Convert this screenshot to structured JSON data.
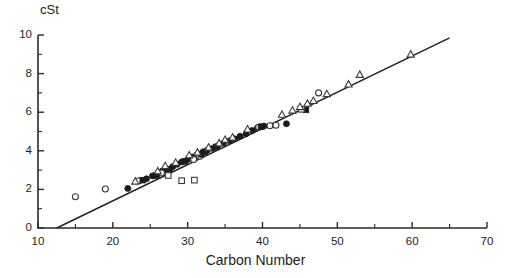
{
  "chart_data": {
    "type": "scatter",
    "title": "",
    "xlabel": "Carbon Number",
    "ylabel": "cSt",
    "ylabel_position": "top-left",
    "xlim": [
      10,
      70
    ],
    "ylim": [
      0,
      10
    ],
    "xticks": [
      10,
      20,
      30,
      40,
      50,
      60,
      70
    ],
    "yticks": [
      0,
      2,
      4,
      6,
      8,
      10
    ],
    "xtick_labels": [
      "10",
      "20",
      "30",
      "40",
      "50",
      "60",
      "70"
    ],
    "ytick_labels": [
      "0",
      "2",
      "4",
      "6",
      "8",
      "10"
    ],
    "x_minor_interval": 5,
    "y_minor_interval": 1,
    "grid": false,
    "legend": "none",
    "frame": "left-and-bottom-spines",
    "fit_line": {
      "name": "regression line",
      "x_start": 12.5,
      "y_start": 0.0,
      "x_end": 65.0,
      "y_end": 9.85,
      "slope": 0.1876,
      "intercept": -2.345
    },
    "series": [
      {
        "name": "filled-circle",
        "marker": "filled circle",
        "points": [
          [
            22.0,
            2.05
          ],
          [
            24.5,
            2.55
          ],
          [
            25.3,
            2.7
          ],
          [
            26.0,
            2.8
          ],
          [
            26.6,
            2.95
          ],
          [
            27.2,
            3.02
          ],
          [
            28.0,
            3.18
          ],
          [
            28.6,
            3.3
          ],
          [
            29.2,
            3.42
          ],
          [
            30.0,
            3.55
          ],
          [
            30.6,
            3.68
          ],
          [
            31.2,
            3.78
          ],
          [
            32.0,
            3.92
          ],
          [
            32.6,
            4.02
          ],
          [
            33.3,
            4.12
          ],
          [
            34.0,
            4.25
          ],
          [
            34.8,
            4.4
          ],
          [
            35.6,
            4.52
          ],
          [
            36.3,
            4.62
          ],
          [
            37.0,
            4.75
          ],
          [
            37.8,
            4.88
          ],
          [
            38.6,
            5.05
          ],
          [
            39.3,
            5.18
          ],
          [
            40.2,
            5.28
          ],
          [
            43.2,
            5.4
          ]
        ]
      },
      {
        "name": "open-circle",
        "marker": "open circle",
        "points": [
          [
            15.0,
            1.62
          ],
          [
            19.0,
            2.02
          ],
          [
            23.5,
            2.45
          ],
          [
            26.5,
            2.85
          ],
          [
            30.8,
            3.55
          ],
          [
            31.6,
            3.72
          ],
          [
            39.5,
            5.22
          ],
          [
            41.0,
            5.3
          ],
          [
            41.8,
            5.32
          ],
          [
            47.5,
            7.0
          ]
        ]
      },
      {
        "name": "filled-square",
        "marker": "filled square",
        "points": [
          [
            24.0,
            2.48
          ],
          [
            25.8,
            2.72
          ],
          [
            27.6,
            3.05
          ],
          [
            29.6,
            3.45
          ],
          [
            31.8,
            3.82
          ],
          [
            32.3,
            3.95
          ],
          [
            33.8,
            4.2
          ],
          [
            39.8,
            5.25
          ],
          [
            45.8,
            6.12
          ]
        ]
      },
      {
        "name": "open-square",
        "marker": "open square",
        "points": [
          [
            27.4,
            2.72
          ],
          [
            29.2,
            2.45
          ],
          [
            30.9,
            2.48
          ],
          [
            45.2,
            6.15
          ]
        ]
      },
      {
        "name": "open-triangle",
        "marker": "open triangle",
        "points": [
          [
            23.0,
            2.42
          ],
          [
            26.0,
            2.95
          ],
          [
            27.0,
            3.22
          ],
          [
            28.4,
            3.4
          ],
          [
            30.2,
            3.78
          ],
          [
            31.3,
            3.92
          ],
          [
            32.8,
            4.18
          ],
          [
            34.2,
            4.4
          ],
          [
            35.0,
            4.58
          ],
          [
            36.0,
            4.7
          ],
          [
            38.0,
            5.12
          ],
          [
            42.6,
            5.88
          ],
          [
            44.0,
            6.1
          ],
          [
            45.0,
            6.28
          ],
          [
            46.0,
            6.45
          ],
          [
            46.8,
            6.6
          ],
          [
            48.6,
            6.95
          ],
          [
            51.5,
            7.45
          ],
          [
            53.0,
            7.95
          ],
          [
            59.8,
            9.0
          ]
        ]
      }
    ]
  }
}
